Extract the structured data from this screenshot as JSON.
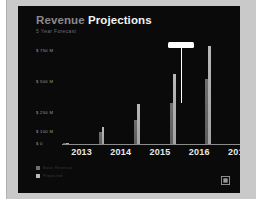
{
  "header": {
    "title_light": "Revenue",
    "title_bold": "Projections",
    "subtitle": "5 Year Forecast"
  },
  "logo": {
    "name": "brand-mark-icon"
  },
  "chart_data": {
    "type": "bar",
    "title": "Revenue Projections",
    "subtitle": "5 Year Forecast",
    "xlabel": "",
    "ylabel": "",
    "categories": [
      "2013",
      "2014",
      "2015",
      "2016",
      "2017"
    ],
    "ytick_labels": [
      "$ 750 M",
      "$ 500 M",
      "$ 250 M",
      "$ 100 M",
      "$ 0"
    ],
    "ytick_values": [
      750,
      500,
      250,
      100,
      0
    ],
    "ylim": [
      0,
      820
    ],
    "grid": false,
    "legend_position": "bottom-left",
    "series": [
      {
        "name": "Base Revenue",
        "color": "#6f6f6f",
        "values": [
          12,
          95,
          190,
          330,
          520
        ]
      },
      {
        "name": "Projected",
        "color": "#b9b9b9",
        "values": [
          12,
          140,
          320,
          560,
          790
        ]
      }
    ],
    "annotation": {
      "label": "",
      "attached_to_category": "2016",
      "attached_to_series": "Base Revenue",
      "color": "#ffffff"
    }
  }
}
